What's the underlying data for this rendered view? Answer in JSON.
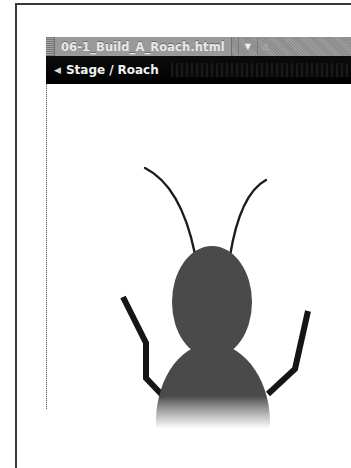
{
  "window": {
    "tab": {
      "label": "06-1_Build_A_Roach.html",
      "dropdown_icon": "▼",
      "warning_icon": "⚠"
    },
    "breadcrumb": {
      "back_icon": "◀",
      "items": [
        "Stage",
        "Roach"
      ],
      "separator": "/"
    }
  },
  "stage": {
    "character": "roach",
    "colors": {
      "body": "#4a4a4a",
      "limbs": "#151515",
      "background": "#ffffff"
    }
  }
}
